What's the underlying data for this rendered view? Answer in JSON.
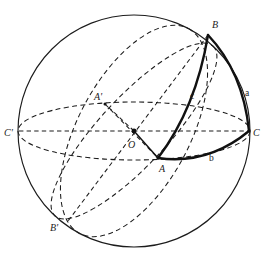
{
  "figure": {
    "background_color": "#ffffff",
    "stroke_color": "#1c1c1c",
    "bold_stroke_color": "#111111",
    "geometry": {
      "sphere_center": {
        "x": 134,
        "y": 131
      },
      "sphere_radius": 116,
      "equator_semi_minor": 29
    },
    "vertices": [
      {
        "id": "B",
        "label": "B",
        "x": 208,
        "y": 35,
        "label_x": 212,
        "label_y": 28
      },
      {
        "id": "A",
        "label": "A",
        "x": 158,
        "y": 158,
        "label_x": 159,
        "label_y": 172
      },
      {
        "id": "C",
        "label": "C",
        "x": 249,
        "y": 131,
        "label_x": 253,
        "label_y": 136
      },
      {
        "id": "Cp",
        "label": "C'",
        "x": 19,
        "y": 131,
        "label_x": 4,
        "label_y": 136
      },
      {
        "id": "Ap",
        "label": "A'",
        "x": 105,
        "y": 104,
        "label_x": 96,
        "label_y": 100
      },
      {
        "id": "Bp",
        "label": "B'",
        "x": 68,
        "y": 221,
        "label_x": 52,
        "label_y": 231
      },
      {
        "id": "O",
        "label": "O",
        "x": 134,
        "y": 131,
        "label_x": 130,
        "label_y": 147
      }
    ],
    "sides": [
      {
        "id": "a",
        "label": "a",
        "label_x": 245,
        "label_y": 96,
        "between": "B-C"
      },
      {
        "id": "b",
        "label": "b",
        "label_x": 209,
        "label_y": 161,
        "between": "A-C"
      },
      {
        "id": "c",
        "label": "c",
        "label_x": 191,
        "label_y": 99,
        "between": "A-B"
      }
    ]
  }
}
